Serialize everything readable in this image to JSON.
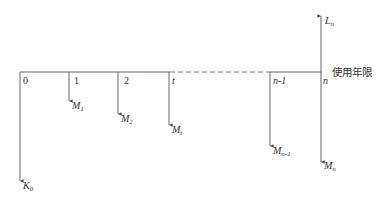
{
  "diagram": {
    "type": "cash-flow-diagram",
    "axis_label": "使用年限",
    "colors": {
      "line": "#555555",
      "text": "#333333",
      "background": "#ffffff"
    },
    "ticks": [
      {
        "label": "0",
        "italic": false
      },
      {
        "label": "1",
        "italic": false
      },
      {
        "label": "2",
        "italic": false
      },
      {
        "label": "t",
        "italic": true
      },
      {
        "label": "n-1",
        "italic": true
      },
      {
        "label": "n",
        "italic": true
      }
    ],
    "flows": [
      {
        "symbol": "K",
        "sub": "0",
        "direction": "down",
        "at": "0"
      },
      {
        "symbol": "M",
        "sub": "1",
        "direction": "down",
        "at": "1"
      },
      {
        "symbol": "M",
        "sub": "2",
        "direction": "down",
        "at": "2"
      },
      {
        "symbol": "M",
        "sub": "t",
        "direction": "down",
        "at": "t"
      },
      {
        "symbol": "M",
        "sub": "n-1",
        "direction": "down",
        "at": "n-1"
      },
      {
        "symbol": "M",
        "sub": "n",
        "direction": "down",
        "at": "n"
      },
      {
        "symbol": "L",
        "sub": "n",
        "direction": "up",
        "at": "n"
      }
    ]
  }
}
